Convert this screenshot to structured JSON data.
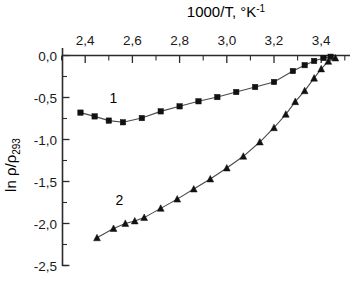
{
  "chart_data": {
    "type": "scatter",
    "title": "1000/T, °K-1",
    "title_main": "1000/T, ",
    "title_deg": "°K",
    "title_exp": "-1",
    "xlabel": "1000/T, °K-1",
    "ylabel": "ln ρ/ρ293",
    "ylabel_main": "ln ρ/ρ",
    "ylabel_sub": "293",
    "xlim": [
      2.3,
      3.52
    ],
    "ylim": [
      -2.5,
      0.0
    ],
    "x_axis_position": "top",
    "grid": false,
    "legend": "inline-curve-numbers",
    "xticks": [
      2.4,
      2.6,
      2.8,
      3.0,
      3.2,
      3.4
    ],
    "xticklabels": [
      "2,4",
      "2,6",
      "2,8",
      "3,0",
      "3,2",
      "3,4"
    ],
    "x_minor_ticks": [
      2.3,
      2.5,
      2.7,
      2.9,
      3.1,
      3.3,
      3.5
    ],
    "yticks": [
      0.0,
      -0.5,
      -1.0,
      -1.5,
      -2.0,
      -2.5
    ],
    "yticklabels": [
      "0,0",
      "-0,5",
      "-1,0",
      "-1,5",
      "-2,0",
      "-2,5"
    ],
    "y_minor_ticks": [
      -0.25,
      -0.75,
      -1.25,
      -1.75,
      -2.25
    ],
    "series": [
      {
        "name": "1",
        "label": "1",
        "marker": "square",
        "color": "#111111",
        "label_x": 2.52,
        "label_y": -0.565,
        "x": [
          2.38,
          2.44,
          2.5,
          2.56,
          2.64,
          2.72,
          2.8,
          2.88,
          2.96,
          3.04,
          3.12,
          3.2,
          3.28,
          3.33,
          3.37,
          3.41,
          3.44
        ],
        "y": [
          -0.68,
          -0.725,
          -0.775,
          -0.795,
          -0.745,
          -0.665,
          -0.605,
          -0.545,
          -0.495,
          -0.435,
          -0.375,
          -0.315,
          -0.185,
          -0.115,
          -0.065,
          -0.03,
          -0.015
        ]
      },
      {
        "name": "2",
        "label": "2",
        "marker": "triangle",
        "color": "#111111",
        "label_x": 2.545,
        "label_y": -1.775,
        "x": [
          2.45,
          2.52,
          2.57,
          2.61,
          2.65,
          2.72,
          2.79,
          2.86,
          2.93,
          3.0,
          3.07,
          3.14,
          3.2,
          3.25,
          3.29,
          3.33,
          3.37,
          3.4,
          3.43,
          3.46
        ],
        "y": [
          -2.17,
          -2.06,
          -2.0,
          -1.97,
          -1.93,
          -1.82,
          -1.71,
          -1.59,
          -1.47,
          -1.34,
          -1.2,
          -1.03,
          -0.86,
          -0.7,
          -0.55,
          -0.42,
          -0.27,
          -0.16,
          -0.07,
          -0.03
        ]
      }
    ]
  }
}
